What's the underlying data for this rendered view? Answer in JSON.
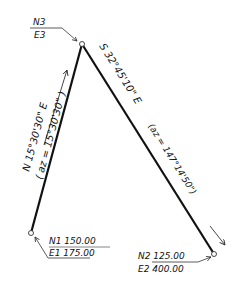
{
  "diagram": {
    "points": {
      "p1": {
        "north_label": "N1 150.00",
        "east_label": "E1 175.00"
      },
      "p2": {
        "north_label": "N2 125.00",
        "east_label": "E2 400.00"
      },
      "p3": {
        "north_label": "N3",
        "east_label": "E3"
      }
    },
    "lines": {
      "p1_p3": {
        "bearing": "N 15°30'30\" E",
        "azimuth": "( az = 15°30'30\" )"
      },
      "p3_p2": {
        "bearing": "S 32°45'10\" E",
        "azimuth": "(az = 147°14'50\")"
      }
    },
    "colors": {
      "line": "#111111",
      "background": "#ffffff"
    }
  }
}
